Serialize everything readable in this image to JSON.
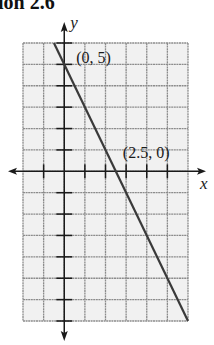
{
  "header": {
    "title": "ion 2.6"
  },
  "chart_data": {
    "type": "line",
    "title": "ion 2.6",
    "xlabel": "x",
    "ylabel": "y",
    "xlim": [
      -2,
      6
    ],
    "ylim": [
      -7,
      6
    ],
    "grid": true,
    "grid_step": 1,
    "series": [
      {
        "name": "y = -2x + 5",
        "x": [
          -0.5,
          6
        ],
        "y": [
          6,
          -7
        ]
      }
    ],
    "points": [
      {
        "label": "(0, 5)",
        "x": 0,
        "y": 5
      },
      {
        "label": "(2.5, 0)",
        "x": 2.5,
        "y": 0
      }
    ],
    "x_ticks": [
      -1,
      1,
      2,
      3,
      4,
      5
    ],
    "y_ticks": [
      6,
      5,
      4,
      3,
      2,
      1,
      -1,
      -2,
      -3,
      -4,
      -5,
      -6,
      -7
    ]
  },
  "colors": {
    "grid_bg": "#f1f1f1",
    "grid_line": "#8c8c8c",
    "axis": "#1a1a1a",
    "plot_line": "#3a3a3a"
  }
}
